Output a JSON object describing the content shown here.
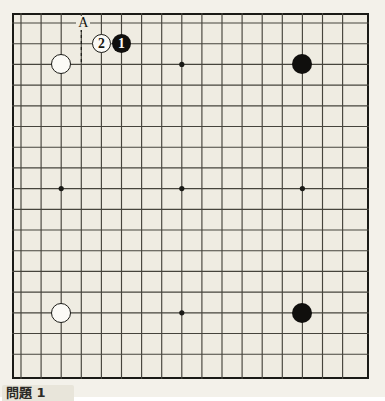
{
  "figure": {
    "kind": "go-board-diagram",
    "caption": "問題 1",
    "board_size": 19,
    "visible_columns": 17,
    "visible_rows": 17,
    "colors": {
      "paper": "#f3f1ea",
      "board": "#efece2",
      "line": "#46443c",
      "border": "#1a1a16",
      "black_stone": "#100f0d",
      "white_stone": "#fbfaf6"
    }
  },
  "board": {
    "origin_x": 12,
    "origin_y": 13,
    "width": 357,
    "height": 366,
    "cell_w": 20.1,
    "cell_h": 20.7,
    "first_line_x": 21,
    "first_line_y": 23,
    "cols": 17,
    "rows": 17
  },
  "star_points": [
    {
      "name": "star-top-center",
      "col": 8,
      "row": 2
    },
    {
      "name": "star-middle-left",
      "col": 2,
      "row": 8
    },
    {
      "name": "star-center",
      "col": 8,
      "row": 8
    },
    {
      "name": "star-middle-right",
      "col": 14,
      "row": 8
    },
    {
      "name": "star-bottom-center",
      "col": 8,
      "row": 14
    }
  ],
  "stones": [
    {
      "name": "white-stone-upper-left",
      "color": "white",
      "col": 2,
      "row": 2,
      "radius": 10,
      "label": ""
    },
    {
      "name": "black-stone-upper-right",
      "color": "black",
      "col": 14,
      "row": 2,
      "radius": 10,
      "label": ""
    },
    {
      "name": "white-stone-lower-left",
      "color": "white",
      "col": 2,
      "row": 14,
      "radius": 10,
      "label": ""
    },
    {
      "name": "black-stone-lower-right",
      "color": "black",
      "col": 14,
      "row": 14,
      "radius": 10,
      "label": ""
    },
    {
      "name": "white-move-2",
      "color": "white",
      "col": 4,
      "row": 1,
      "radius": 9.5,
      "label": "2"
    },
    {
      "name": "black-move-1",
      "color": "black",
      "col": 5,
      "row": 1,
      "radius": 9.5,
      "label": "1"
    }
  ],
  "labels": [
    {
      "name": "point-label-a",
      "text": "A",
      "col": 3,
      "row": 0
    }
  ]
}
